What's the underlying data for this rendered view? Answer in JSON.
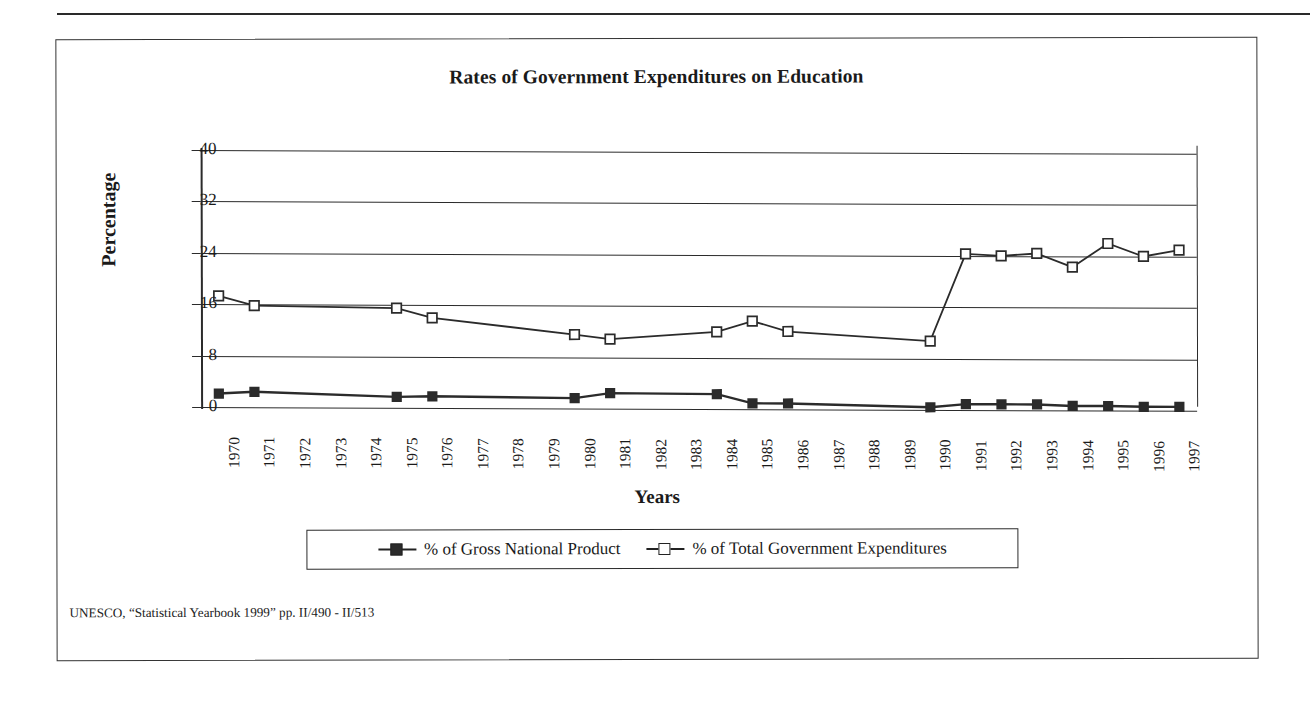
{
  "chart_data": {
    "type": "line",
    "title": "Rates of Government Expenditures on Education",
    "xlabel": "Years",
    "ylabel": "Percentage",
    "ylim": [
      0,
      40
    ],
    "yticks": [
      0,
      8,
      16,
      24,
      32,
      40
    ],
    "grid": true,
    "legend_position": "bottom",
    "categories": [
      "1970",
      "1971",
      "1972",
      "1973",
      "1974",
      "1975",
      "1976",
      "1977",
      "1978",
      "1979",
      "1980",
      "1981",
      "1982",
      "1983",
      "1984",
      "1985",
      "1986",
      "1987",
      "1988",
      "1989",
      "1990",
      "1991",
      "1992",
      "1993",
      "1994",
      "1995",
      "1996",
      "1997"
    ],
    "series": [
      {
        "name": "% of Gross National Product",
        "marker": "filled-square",
        "values": [
          2.1,
          2.4,
          null,
          null,
          null,
          1.7,
          1.8,
          null,
          null,
          null,
          1.6,
          2.4,
          null,
          null,
          2.3,
          0.9,
          0.9,
          null,
          null,
          null,
          0.4,
          0.9,
          0.9,
          0.9,
          0.7,
          0.7,
          0.6,
          0.6
        ]
      },
      {
        "name": "% of Total Government Expenditures",
        "marker": "open-square",
        "values": [
          17.3,
          15.8,
          null,
          null,
          null,
          15.5,
          14.0,
          null,
          null,
          null,
          11.5,
          10.8,
          null,
          null,
          12.0,
          13.7,
          12.1,
          null,
          null,
          null,
          10.7,
          24.3,
          24.0,
          24.4,
          22.3,
          26.0,
          24.0,
          25.0
        ]
      }
    ],
    "source_note": "UNESCO, “Statistical Yearbook 1999” pp. II/490 - II/513"
  },
  "colors": {
    "ink": "#2b2b2b",
    "background": "#ffffff"
  }
}
